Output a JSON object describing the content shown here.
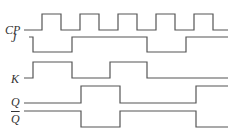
{
  "diagram": {
    "type": "timing-diagram",
    "stroke_color": "#555555",
    "signals": [
      {
        "name": "CP",
        "label": "CP",
        "overline": false,
        "levels_desc": "clock: 5 pulses",
        "points": "24,30 42,30 42,14 61,14 61,30 80,30 80,14 99,14 99,30 118,30 118,14 137,14 137,30 156,30 156,14 175,14 175,30 194,30 194,14 213,14 213,30 228,30"
      },
      {
        "name": "J",
        "label": "J",
        "overline": false,
        "levels": [
          1,
          0,
          1,
          1,
          0,
          1
        ],
        "points": "29,37 33,37 33,52 72,52 72,37 147,37 147,52 186,52 186,37 228,37"
      },
      {
        "name": "K",
        "label": "K",
        "overline": false,
        "levels": [
          0,
          1,
          0,
          1,
          0,
          0
        ],
        "points": "24,78 33,78 33,62 72,62 72,78 110,78 110,62 147,62 147,78 228,78"
      },
      {
        "name": "Q",
        "label": "Q",
        "overline": false,
        "levels": [
          0,
          1,
          0,
          0,
          1
        ],
        "points": "24,103 81,103 81,86 120,86 120,103 196,103 196,86 228,86"
      },
      {
        "name": "Q_bar",
        "label": "Q",
        "overline": true,
        "levels": [
          1,
          0,
          1,
          1,
          0
        ],
        "points": "24,111 81,111 81,127 120,127 120,111 196,111 196,127 228,127"
      }
    ]
  }
}
